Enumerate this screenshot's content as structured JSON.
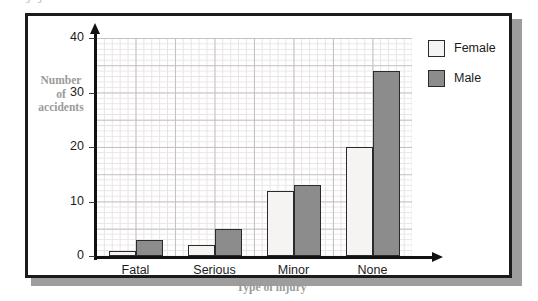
{
  "figure": {
    "top_remnant_text": "J J",
    "frame_color": "#1b1b1b",
    "shadow_color": "#9d9d9d",
    "background": "#ffffff"
  },
  "chart_data": {
    "type": "bar",
    "title": "",
    "subtitle": "",
    "xlabel": "Type of injury",
    "ylabel": "Number of accidents",
    "ylabel_lines": [
      "Number",
      "of",
      "accidents"
    ],
    "categories": [
      "Fatal",
      "Serious",
      "Minor",
      "None"
    ],
    "series": [
      {
        "name": "Female",
        "color": "#f5f4f2",
        "values": [
          1,
          2,
          12,
          20
        ]
      },
      {
        "name": "Male",
        "color": "#8c8c8c",
        "values": [
          3,
          5,
          13,
          34
        ]
      }
    ],
    "ylim": [
      0,
      40
    ],
    "ytick_labels": [
      "0",
      "10",
      "20",
      "30",
      "40"
    ],
    "ytick_values": [
      0,
      10,
      20,
      30,
      40
    ],
    "y_major_step": 5,
    "y_minor_step": 1,
    "grid": true,
    "grid_minor_color": "#e9e4e4",
    "grid_major_color": "#c6c2c2",
    "legend_position": "top-right",
    "axis_color": "#111111",
    "axis_arrows": true,
    "label_color": "#9a9a9a"
  },
  "legend": {
    "items": [
      {
        "label": "Female",
        "swatch": "female"
      },
      {
        "label": "Male",
        "swatch": "male"
      }
    ]
  }
}
